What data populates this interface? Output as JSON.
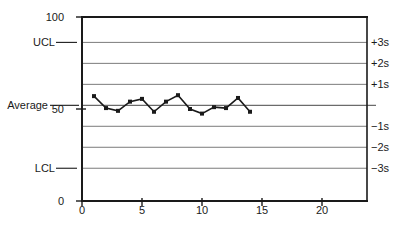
{
  "chart_data": {
    "type": "line",
    "title": "",
    "x": [
      1,
      2,
      3,
      4,
      5,
      6,
      7,
      8,
      9,
      10,
      11,
      12,
      13,
      14
    ],
    "values": [
      57,
      50.5,
      49,
      54,
      55.5,
      48.5,
      54,
      57.5,
      50,
      47.5,
      51,
      50.5,
      56,
      48.5
    ],
    "xlim": [
      0,
      23.75
    ],
    "ylim": [
      0,
      100
    ],
    "x_ticks": [
      0,
      5,
      10,
      15,
      20
    ],
    "y_ticks": [
      100,
      50,
      0
    ],
    "center": 52,
    "sigma": 11.4,
    "sigma_levels": [
      3,
      2,
      1,
      -1,
      -2,
      -3
    ],
    "right_labels": [
      "+3s",
      "+2s",
      "+1s",
      "−1s",
      "−2s",
      "−3s"
    ],
    "left_labels": {
      "ucl": "UCL",
      "average": "Average",
      "lcl": "LCL"
    },
    "legend": "none",
    "grid": "horizontal-sigma-lines",
    "colors": {
      "axis": "#1a1a1a",
      "sigma_line": "#7b7b7b",
      "center_line": "#6b6b6b",
      "data_line": "#1a1a1a",
      "marker": "#1a1a1a",
      "background": "#ffffff"
    }
  }
}
